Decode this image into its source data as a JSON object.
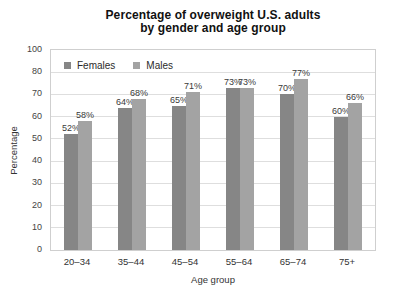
{
  "title": {
    "line1": "Percentage of overweight U.S. adults",
    "line2": "by gender and age group"
  },
  "chart_data": {
    "type": "bar",
    "title": "Percentage of overweight U.S. adults by gender and age group",
    "categories": [
      "20–34",
      "35–44",
      "45–54",
      "55–64",
      "65–74",
      "75+"
    ],
    "series": [
      {
        "name": "Females",
        "color": "#868686",
        "values": [
          52,
          64,
          65,
          73,
          70,
          60
        ]
      },
      {
        "name": "Males",
        "color": "#a3a3a3",
        "values": [
          58,
          68,
          71,
          73,
          77,
          66
        ]
      }
    ],
    "value_suffix": "%",
    "xlabel": "Age group",
    "ylabel": "Percentage",
    "y_ticks": [
      100,
      80,
      70,
      60,
      50,
      40,
      30,
      20,
      10,
      0
    ],
    "units_per_interval": 10,
    "grid": true,
    "legend_position": "top-left"
  },
  "colors": {
    "background": "#ffffff",
    "grid": "#dedede",
    "plot_border": "#cfcfcf",
    "axis_text": "#444444",
    "title_text": "#111111",
    "bar_label_text": "#3a3a3a"
  }
}
